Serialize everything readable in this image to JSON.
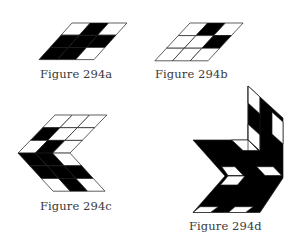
{
  "figures": [
    {
      "id": "294a",
      "caption": "Figure 294a",
      "type": "sheared-grid",
      "origin": [
        72,
        23
      ],
      "col_width": 18.3,
      "row_height": 12.2,
      "shear": -0.9,
      "rows": [
        [
          "W",
          "B",
          "W"
        ],
        [
          "B",
          "B",
          "B"
        ],
        [
          "B",
          "B",
          "W"
        ]
      ]
    },
    {
      "id": "294b",
      "caption": "Figure 294b",
      "type": "sheared-grid",
      "origin": [
        190,
        23
      ],
      "col_width": 17.7,
      "row_height": 12.6,
      "shear": -0.93,
      "rows": [
        [
          "W",
          "B",
          "W"
        ],
        [
          "W",
          "W",
          "B"
        ],
        [
          "W",
          "W",
          "W"
        ]
      ]
    },
    {
      "id": "294c",
      "caption": "Figure 294c",
      "type": "chevron",
      "direction": "left-pointing",
      "origin": [
        55,
        115
      ],
      "col_width": 17.3,
      "row_height": 12.7,
      "upper_shear": -0.97,
      "lower_shear": 0.92,
      "upper_rows": [
        [
          "W",
          "W",
          "W"
        ],
        [
          "B",
          "W",
          "W"
        ],
        [
          "W",
          "B",
          "W"
        ]
      ],
      "lower_rows": [
        [
          "B",
          "B",
          "W"
        ],
        [
          "B",
          "B",
          "B"
        ],
        [
          "W",
          "B",
          "W"
        ]
      ]
    },
    {
      "id": "294d",
      "caption": "Figure 294d",
      "type": "polygons",
      "silhouette": [
        [
          248,
          86
        ],
        [
          283,
          118
        ],
        [
          283,
          178
        ],
        [
          260,
          212.5
        ],
        [
          193,
          212.5
        ],
        [
          225,
          176
        ],
        [
          193,
          140
        ],
        [
          248,
          140
        ]
      ],
      "white_cells": [
        [
          [
            248,
            86
          ],
          [
            260,
            97
          ],
          [
            260,
            114
          ],
          [
            248,
            103
          ]
        ],
        [
          [
            248,
            124
          ],
          [
            260,
            135
          ],
          [
            260,
            151
          ],
          [
            248,
            140
          ]
        ],
        [
          [
            272,
            112
          ],
          [
            283,
            122
          ],
          [
            283,
            144
          ],
          [
            272,
            134
          ]
        ],
        [
          [
            231.7,
            140
          ],
          [
            248.3,
            140
          ],
          [
            258.3,
            150.5
          ],
          [
            243,
            150.5
          ]
        ],
        [
          [
            221.7,
            166.7
          ],
          [
            235,
            166.7
          ],
          [
            243.3,
            175.5
          ],
          [
            228,
            175.5
          ]
        ],
        [
          [
            256.7,
            166.7
          ],
          [
            273.3,
            166.7
          ],
          [
            281.7,
            175.5
          ],
          [
            265,
            175.5
          ]
        ],
        [
          [
            228,
            176
          ],
          [
            245,
            176
          ],
          [
            237.5,
            185
          ],
          [
            220.5,
            185
          ]
        ],
        [
          [
            200,
            206.7
          ],
          [
            218.3,
            206.7
          ],
          [
            210.5,
            212.5
          ],
          [
            193,
            212.5
          ]
        ],
        [
          [
            235,
            206.7
          ],
          [
            253.3,
            206.7
          ],
          [
            245.5,
            212.5
          ],
          [
            228.3,
            212.5
          ]
        ]
      ],
      "edge_lines": [
        [
          [
            248,
            86
          ],
          [
            248,
            151
          ]
        ],
        [
          [
            248,
            140
          ],
          [
            260,
            151
          ]
        ],
        [
          [
            260,
            97
          ],
          [
            260,
            151
          ]
        ]
      ]
    }
  ],
  "colors": {
    "fill_black": "#000000",
    "fill_white": "#ffffff",
    "stroke": "#1a1a1a",
    "caption_text": "#3a3a3a"
  }
}
